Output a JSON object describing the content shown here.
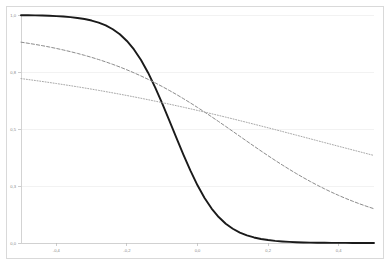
{
  "chart_data": {
    "type": "line",
    "title": "",
    "subtitle": "",
    "xlabel": "",
    "ylabel": "",
    "xlim": [
      -0.5,
      0.5
    ],
    "ylim": [
      0.0,
      1.0
    ],
    "grid": "horizontal",
    "legend_position": "none",
    "x_tick_labels": [
      "-0,4",
      "-0,2",
      "0,0",
      "0,2",
      "0,4"
    ],
    "x_tick_values": [
      -0.4,
      -0.2,
      0.0,
      0.2,
      0.4
    ],
    "y_tick_labels": [
      "0,0",
      "0,3",
      "0,5",
      "0,8",
      "1,0"
    ],
    "y_tick_values": [
      0.0,
      0.25,
      0.5,
      0.75,
      1.0
    ],
    "x": [
      -0.5,
      -0.48,
      -0.46,
      -0.44,
      -0.42,
      -0.4,
      -0.38,
      -0.36,
      -0.34,
      -0.32,
      -0.3,
      -0.28,
      -0.26,
      -0.24,
      -0.22,
      -0.2,
      -0.18,
      -0.16,
      -0.14,
      -0.12,
      -0.1,
      -0.08,
      -0.06,
      -0.04,
      -0.02,
      0.0,
      0.02,
      0.04,
      0.06,
      0.08,
      0.1,
      0.12,
      0.14,
      0.16,
      0.18,
      0.2,
      0.22,
      0.24,
      0.26,
      0.28,
      0.3,
      0.32,
      0.34,
      0.36,
      0.38,
      0.4,
      0.42,
      0.44,
      0.46,
      0.48,
      0.5
    ],
    "series": [
      {
        "name": "steep-sigmoid",
        "style": "solid",
        "color": "#1a1a1a",
        "width": 1.9,
        "values": [
          0.9991,
          0.9987,
          0.9982,
          0.9975,
          0.9965,
          0.9951,
          0.9933,
          0.9907,
          0.9871,
          0.9823,
          0.9757,
          0.9666,
          0.9542,
          0.9375,
          0.9153,
          0.8862,
          0.849,
          0.8027,
          0.747,
          0.6827,
          0.612,
          0.538,
          0.462,
          0.388,
          0.3173,
          0.253,
          0.1973,
          0.151,
          0.1138,
          0.0847,
          0.0625,
          0.0458,
          0.0334,
          0.0243,
          0.0177,
          0.0129,
          0.0093,
          0.0068,
          0.0049,
          0.0035,
          0.0025,
          0.0018,
          0.0013,
          0.0009,
          0.0007,
          0.0005,
          0.0004,
          0.0003,
          0.0002,
          0.0001,
          0.0001
        ]
      },
      {
        "name": "medium-sigmoid",
        "style": "dashed",
        "color": "#8c8c8c",
        "width": 1.0,
        "values": [
          0.8808,
          0.8761,
          0.871,
          0.8656,
          0.8597,
          0.8534,
          0.8466,
          0.8393,
          0.8315,
          0.8231,
          0.8142,
          0.8046,
          0.7944,
          0.7835,
          0.7719,
          0.7595,
          0.7464,
          0.7326,
          0.7179,
          0.7025,
          0.6863,
          0.6693,
          0.6517,
          0.6333,
          0.6142,
          0.5945,
          0.5743,
          0.5536,
          0.5325,
          0.5112,
          0.4896,
          0.4679,
          0.4463,
          0.4248,
          0.4036,
          0.3827,
          0.3623,
          0.3424,
          0.3231,
          0.3045,
          0.2866,
          0.2694,
          0.253,
          0.2374,
          0.2226,
          0.2086,
          0.1954,
          0.183,
          0.1713,
          0.1604,
          0.1502
        ]
      },
      {
        "name": "shallow-sigmoid",
        "style": "dotted",
        "color": "#a8a8a8",
        "width": 1.0,
        "values": [
          0.7211,
          0.717,
          0.7128,
          0.7085,
          0.704,
          0.6995,
          0.6948,
          0.69,
          0.6851,
          0.68,
          0.6748,
          0.6695,
          0.664,
          0.6584,
          0.6527,
          0.6469,
          0.6409,
          0.6348,
          0.6286,
          0.6222,
          0.6157,
          0.6091,
          0.6023,
          0.5955,
          0.5885,
          0.5814,
          0.5742,
          0.5669,
          0.5595,
          0.552,
          0.5444,
          0.5367,
          0.529,
          0.5211,
          0.5132,
          0.5053,
          0.4973,
          0.4892,
          0.4811,
          0.473,
          0.4649,
          0.4567,
          0.4486,
          0.4404,
          0.4323,
          0.4241,
          0.416,
          0.4079,
          0.3999,
          0.3918,
          0.3839
        ]
      }
    ]
  }
}
